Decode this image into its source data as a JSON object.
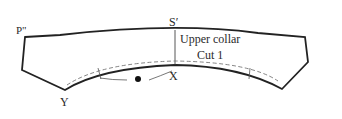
{
  "diagram": {
    "piece_name": "Upper collar",
    "cut_instruction": "Cut 1",
    "points": {
      "p_double_prime": "P\"",
      "s_prime": "S′",
      "x": "X",
      "y": "Y"
    },
    "colors": {
      "outline": "#222222",
      "dashed_line": "#777777",
      "guide_line": "#555555",
      "background": "#ffffff"
    }
  }
}
